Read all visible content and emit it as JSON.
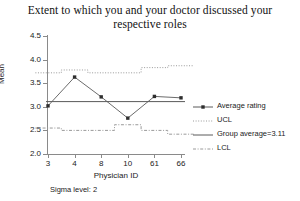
{
  "chart_data": {
    "type": "line",
    "title": "Extent to which you and your doctor discussed your respective roles",
    "xlabel": "Physician ID",
    "ylabel": "Mean",
    "footnote": "Sigma level: 2",
    "categories": [
      "3",
      "4",
      "8",
      "10",
      "61",
      "66"
    ],
    "ylim": [
      2.0,
      4.5
    ],
    "ytick_labels": [
      "4.5",
      "4.0",
      "3.5",
      "3.0",
      "2.5",
      "2.0"
    ],
    "ytick_values": [
      4.5,
      4.0,
      3.5,
      3.0,
      2.5,
      2.0
    ],
    "grid": false,
    "legend_position": "right",
    "group_average": 3.11,
    "series": [
      {
        "name": "Average rating",
        "style": "line-marker",
        "values": [
          3.02,
          3.63,
          3.21,
          2.76,
          3.22,
          3.19
        ]
      },
      {
        "name": "UCL",
        "style": "dotted-step",
        "values": [
          3.72,
          3.78,
          3.72,
          3.72,
          3.83,
          3.87
        ]
      },
      {
        "name": "Group average=3.11",
        "style": "solid",
        "values": [
          3.11,
          3.11,
          3.11,
          3.11,
          3.11,
          3.11
        ]
      },
      {
        "name": "LCL",
        "style": "dashdot-step",
        "values": [
          2.55,
          2.5,
          2.5,
          2.62,
          2.5,
          2.42
        ]
      }
    ]
  },
  "legend": {
    "items": [
      {
        "label": "Average rating",
        "key": "line-marker"
      },
      {
        "label": "UCL",
        "key": "dotted"
      },
      {
        "label": "Group average=3.11",
        "key": "solid"
      },
      {
        "label": "LCL",
        "key": "dashdot"
      }
    ]
  },
  "colors": {
    "axis": "#8a8a8a",
    "series": "#5a5a5a",
    "limit": "#9a9a9a",
    "text": "#222222"
  }
}
